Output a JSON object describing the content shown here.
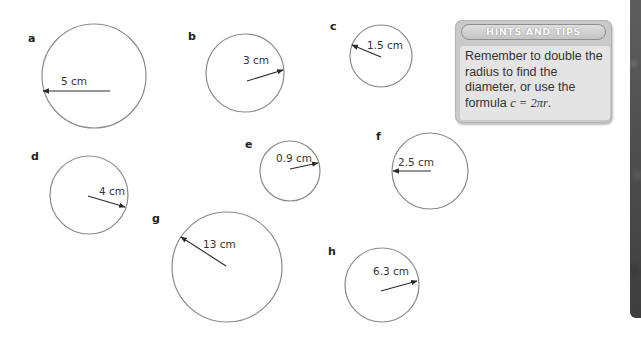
{
  "questions": [
    {
      "label": "a",
      "radius_text": "5 cm",
      "radius_cm": 5,
      "cx": 94,
      "cy": 76,
      "r": 52,
      "label_x": 28,
      "label_y": 42,
      "arrow": {
        "x1": 110,
        "y1": 91,
        "x2": 43,
        "y2": 91
      },
      "text_x": 61,
      "text_y": 85
    },
    {
      "label": "b",
      "radius_text": "3 cm",
      "radius_cm": 3,
      "cx": 245,
      "cy": 73,
      "r": 39,
      "label_x": 188,
      "label_y": 40,
      "arrow": {
        "x1": 247,
        "y1": 81,
        "x2": 283,
        "y2": 70
      },
      "text_x": 243,
      "text_y": 64
    },
    {
      "label": "c",
      "radius_text": "1.5 cm",
      "radius_cm": 1.5,
      "cx": 381,
      "cy": 56,
      "r": 31,
      "label_x": 330,
      "label_y": 30,
      "arrow": {
        "x1": 381,
        "y1": 57,
        "x2": 352,
        "y2": 45
      },
      "text_x": 367,
      "text_y": 49
    },
    {
      "label": "d",
      "radius_text": "4 cm",
      "radius_cm": 4,
      "cx": 89,
      "cy": 195,
      "r": 39,
      "label_x": 31,
      "label_y": 160,
      "arrow": {
        "x1": 88,
        "y1": 196,
        "x2": 125,
        "y2": 207
      },
      "text_x": 99,
      "text_y": 195
    },
    {
      "label": "e",
      "radius_text": "0.9 cm",
      "radius_cm": 0.9,
      "cx": 290,
      "cy": 171,
      "r": 30,
      "label_x": 245,
      "label_y": 148,
      "arrow": {
        "x1": 290,
        "y1": 169,
        "x2": 318,
        "y2": 163
      },
      "text_x": 276,
      "text_y": 162
    },
    {
      "label": "f",
      "radius_text": "2.5 cm",
      "radius_cm": 2.5,
      "cx": 430,
      "cy": 171,
      "r": 38,
      "label_x": 376,
      "label_y": 140,
      "arrow": {
        "x1": 431,
        "y1": 171,
        "x2": 393,
        "y2": 171
      },
      "text_x": 398,
      "text_y": 166
    },
    {
      "label": "g",
      "radius_text": "13 cm",
      "radius_cm": 13,
      "cx": 227,
      "cy": 267,
      "r": 55,
      "label_x": 152,
      "label_y": 222,
      "arrow": {
        "x1": 226,
        "y1": 266,
        "x2": 181,
        "y2": 237
      },
      "text_x": 203,
      "text_y": 248
    },
    {
      "label": "h",
      "radius_text": "6.3 cm",
      "radius_cm": 6.3,
      "cx": 382,
      "cy": 285,
      "r": 37,
      "label_x": 328,
      "label_y": 255,
      "arrow": {
        "x1": 381,
        "y1": 291,
        "x2": 417,
        "y2": 281
      },
      "text_x": 373,
      "text_y": 275
    }
  ],
  "hints": {
    "title": "HINTS AND TIPS",
    "body_text": "Remember to double the radius to find the diameter, or use the",
    "formula_prefix": "formula ",
    "formula": "c = 2πr",
    "formula_suffix": "."
  },
  "colors": {
    "circle_stroke": "#8a8a8a",
    "arrow": "#2a2a2a",
    "hints_box": "#c9c9c9",
    "hints_body": "#e4e4e4",
    "side_strip": "#4a4a4a"
  }
}
